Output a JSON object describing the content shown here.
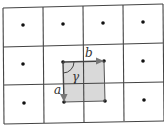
{
  "diagram": {
    "grid": {
      "columns": 4,
      "rows": 3
    },
    "lattice_points": 12,
    "unit_cell": {
      "shaded": true,
      "fill": "#d9d9d9"
    },
    "vectors": [
      {
        "name": "b",
        "label": "b",
        "direction": "right"
      },
      {
        "name": "a",
        "label": "a",
        "direction": "down"
      }
    ],
    "angle": {
      "label": "γ",
      "between": [
        "a",
        "b"
      ]
    },
    "colors": {
      "line": "#333333",
      "arrow": "#666666",
      "dot": "#111111",
      "shade": "#d9d9d9"
    }
  }
}
